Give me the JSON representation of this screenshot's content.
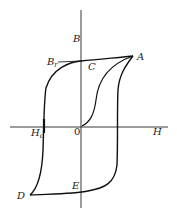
{
  "diagram": {
    "type": "hysteresis-loop",
    "axes": {
      "x_label": "H",
      "y_label": "B",
      "origin_label": "0"
    },
    "points": [
      {
        "id": "A",
        "label": "A"
      },
      {
        "id": "C",
        "label": "C"
      },
      {
        "id": "Br",
        "label": "B",
        "sub": "r"
      },
      {
        "id": "Hc",
        "label": "H",
        "sub": "c"
      },
      {
        "id": "D",
        "label": "D"
      },
      {
        "id": "E",
        "label": "E"
      }
    ],
    "colors": {
      "line": "#111111",
      "text": "#222222",
      "background": "#ffffff"
    }
  }
}
